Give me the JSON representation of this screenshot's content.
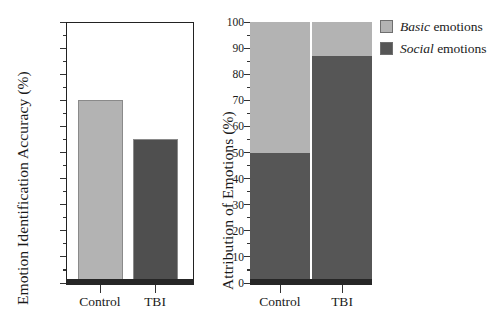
{
  "chart_data": [
    {
      "id": "left-panel",
      "type": "bar",
      "title": "",
      "xlabel": "",
      "ylabel": "Emotion Identification Accuracy (%)",
      "categories": [
        "Control",
        "TBI"
      ],
      "values": [
        70,
        55
      ],
      "ylim": [
        0,
        100
      ],
      "ytick_labels": [
        "0",
        "10",
        "20",
        "30",
        "40",
        "50",
        "60",
        "70",
        "80",
        "90",
        "100"
      ],
      "ytick_values": [
        0,
        10,
        20,
        30,
        40,
        50,
        60,
        70,
        80,
        90,
        100
      ],
      "ytick_minor_step": 5,
      "grid": false,
      "legend": "none",
      "bar_colors": [
        "#b3b3b3",
        "#4f4f4f"
      ],
      "series": [
        {
          "name": "Emotion identification accuracy",
          "values": [
            70,
            55
          ]
        }
      ]
    },
    {
      "id": "right-panel",
      "type": "bar",
      "subtype": "stacked-100",
      "title": "",
      "xlabel": "",
      "ylabel": "Attribution of Emotions (%)",
      "categories": [
        "Control",
        "TBI"
      ],
      "ylim": [
        0,
        100
      ],
      "ytick_labels": [
        "0",
        "10",
        "20",
        "30",
        "40",
        "50",
        "60",
        "70",
        "80",
        "90",
        "100"
      ],
      "ytick_values": [
        0,
        10,
        20,
        30,
        40,
        50,
        60,
        70,
        80,
        90,
        100
      ],
      "ytick_minor_step": 5,
      "grid": false,
      "legend": "upper-right-outside",
      "series": [
        {
          "name": "Social emotions",
          "values": [
            50,
            87
          ],
          "color": "#565656"
        },
        {
          "name": "Basic emotions",
          "values": [
            50,
            13
          ],
          "color": "#b3b3b3"
        }
      ]
    }
  ],
  "left": {
    "axis_title": "Emotion Identification Accuracy (%)",
    "yticks": [
      {
        "label": "100",
        "value": 100
      },
      {
        "label": "90",
        "value": 90
      },
      {
        "label": "80",
        "value": 80
      },
      {
        "label": "70",
        "value": 70
      },
      {
        "label": "60",
        "value": 60
      },
      {
        "label": "50",
        "value": 50
      },
      {
        "label": "40",
        "value": 40
      },
      {
        "label": "30",
        "value": 30
      },
      {
        "label": "20",
        "value": 20
      },
      {
        "label": "10",
        "value": 10
      },
      {
        "label": "0",
        "value": 0
      }
    ],
    "bars": [
      {
        "label": "Control",
        "value": 70,
        "color": "#b3b3b3"
      },
      {
        "label": "TBI",
        "value": 55,
        "color": "#4f4f4f"
      }
    ]
  },
  "right": {
    "axis_title": "Attribution of Emotions (%)",
    "yticks": [
      {
        "label": "100",
        "value": 100
      },
      {
        "label": "90",
        "value": 90
      },
      {
        "label": "80",
        "value": 80
      },
      {
        "label": "70",
        "value": 70
      },
      {
        "label": "60",
        "value": 60
      },
      {
        "label": "50",
        "value": 50
      },
      {
        "label": "40",
        "value": 40
      },
      {
        "label": "30",
        "value": 30
      },
      {
        "label": "20",
        "value": 20
      },
      {
        "label": "10",
        "value": 10
      },
      {
        "label": "0",
        "value": 0
      }
    ],
    "bars": [
      {
        "label": "Control",
        "social": 50,
        "basic": 50
      },
      {
        "label": "TBI",
        "social": 87,
        "basic": 13
      }
    ]
  },
  "legend": {
    "items": [
      {
        "emphasis": "Basic",
        "rest": " emotions",
        "color": "#b3b3b3"
      },
      {
        "emphasis": "Social",
        "rest": " emotions",
        "color": "#565656"
      }
    ]
  },
  "colors": {
    "basic": "#b3b3b3",
    "social": "#565656",
    "tbi_left": "#4f4f4f",
    "control_left": "#b3b3b3",
    "axis": "#262626",
    "background": "#ffffff"
  }
}
